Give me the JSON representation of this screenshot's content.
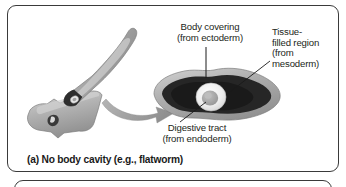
{
  "figure": {
    "panel_a": {
      "caption": "(a) No body cavity (e.g., flatworm)",
      "labels": {
        "body_covering": "Body covering\n(from ectoderm)",
        "tissue_filled": "Tissue-\nfilled region\n(from\nmesoderm)",
        "digestive_tract": "Digestive tract\n(from endoderm)"
      },
      "icons": {
        "transform_arrow": "curved-arrow-icon",
        "whole_worm": "flatworm-body-icon",
        "cut_worm": "flatworm-cut-body-icon",
        "cross_section": "flatworm-cross-section-icon"
      }
    },
    "colors": {
      "border": "#3a3a3a",
      "background": "#ffffff",
      "text": "#231f20",
      "body_covering_grey": "#a8a8a8",
      "body_covering_light": "#cfcfcf",
      "mesoderm_dark": "#2b2b2b",
      "digestive_ring_white": "#f2f2f2",
      "digestive_inner_grey": "#a5a5a5",
      "arrow_grey": "#9a9a9a",
      "leader_line": "#1a1a1a"
    }
  }
}
